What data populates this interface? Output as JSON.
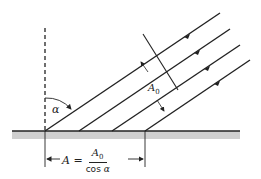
{
  "diagram": {
    "title": "",
    "labels": {
      "angle": "α",
      "beam_width": "A",
      "beam_width_sub": "0",
      "area_lhs": "A =",
      "numerator": "A",
      "numerator_sub": "0",
      "denominator_text": "cos ",
      "denominator_var": "α"
    },
    "elements": [
      {
        "type": "surface",
        "description": "horizontal ground surface with gray shading"
      },
      {
        "type": "normal",
        "description": "dashed vertical normal line"
      },
      {
        "type": "rays",
        "count": 4,
        "direction": "down-left toward surface",
        "arrows": true
      },
      {
        "type": "cross_section",
        "label": "A0",
        "description": "perpendicular width of beam"
      },
      {
        "type": "dimension",
        "label": "A = A0 / cos α",
        "description": "projected area on surface"
      }
    ],
    "colors": {
      "line": "#222222",
      "surface_shade": "#cfcfcf"
    }
  }
}
